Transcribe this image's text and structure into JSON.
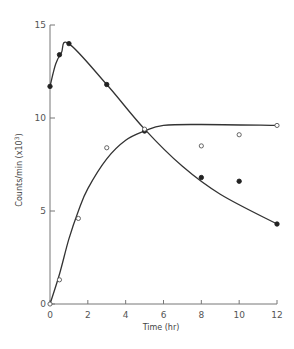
{
  "chart_data": {
    "type": "line",
    "title": "",
    "xlabel": "Time (hr)",
    "ylabel": "Counts/min (x10³)",
    "ylabel_main": "Counts/min (x10",
    "ylabel_exp": "3",
    "ylabel_close": ")",
    "xlim": [
      0,
      12
    ],
    "ylim": [
      0,
      15
    ],
    "xticks": [
      0,
      2,
      4,
      6,
      8,
      10,
      12
    ],
    "yticks": [
      0,
      5,
      10,
      15
    ],
    "grid": false,
    "legend": null,
    "series": [
      {
        "name": "filled circles",
        "marker": "filled-circle",
        "points": [
          {
            "x": 0,
            "y": 11.7
          },
          {
            "x": 0.5,
            "y": 13.4
          },
          {
            "x": 1,
            "y": 14.0
          },
          {
            "x": 3,
            "y": 11.8
          },
          {
            "x": 5,
            "y": 9.3
          },
          {
            "x": 8,
            "y": 6.8
          },
          {
            "x": 10,
            "y": 6.6
          },
          {
            "x": 12,
            "y": 4.3
          }
        ],
        "curve": [
          {
            "x": 0,
            "y": 11.7
          },
          {
            "x": 0.3,
            "y": 12.9
          },
          {
            "x": 0.6,
            "y": 13.5
          },
          {
            "x": 1,
            "y": 14.0
          },
          {
            "x": 3,
            "y": 11.8
          },
          {
            "x": 5,
            "y": 9.4
          },
          {
            "x": 7,
            "y": 7.4
          },
          {
            "x": 9,
            "y": 5.9
          },
          {
            "x": 12,
            "y": 4.3
          }
        ]
      },
      {
        "name": "open circles",
        "marker": "open-circle",
        "points": [
          {
            "x": 0,
            "y": 0
          },
          {
            "x": 0.5,
            "y": 1.3
          },
          {
            "x": 1.5,
            "y": 4.6
          },
          {
            "x": 3,
            "y": 8.4
          },
          {
            "x": 5,
            "y": 9.4
          },
          {
            "x": 8,
            "y": 8.5
          },
          {
            "x": 10,
            "y": 9.1
          },
          {
            "x": 12,
            "y": 9.6
          }
        ],
        "curve": [
          {
            "x": 0,
            "y": 0
          },
          {
            "x": 0.5,
            "y": 1.6
          },
          {
            "x": 1,
            "y": 3.5
          },
          {
            "x": 1.5,
            "y": 5.0
          },
          {
            "x": 2,
            "y": 6.2
          },
          {
            "x": 3,
            "y": 7.8
          },
          {
            "x": 4,
            "y": 8.8
          },
          {
            "x": 5,
            "y": 9.3
          },
          {
            "x": 6,
            "y": 9.6
          },
          {
            "x": 8,
            "y": 9.65
          },
          {
            "x": 12,
            "y": 9.6
          }
        ]
      }
    ]
  }
}
